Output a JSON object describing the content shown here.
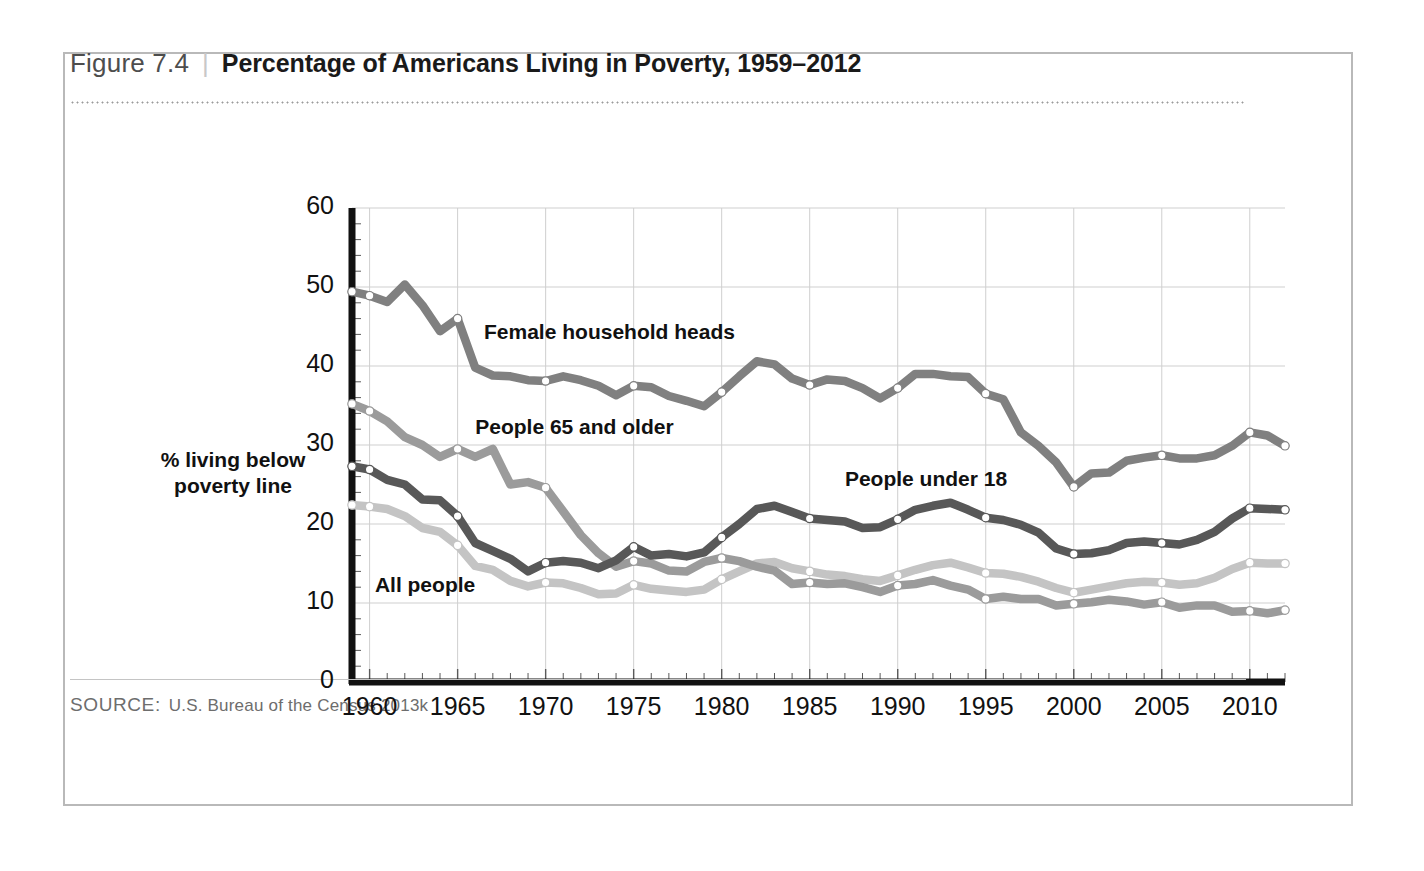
{
  "figure": {
    "number": "Figure 7.4",
    "separator": "|",
    "title": "Percentage of Americans Living in Poverty, 1959–2012"
  },
  "source": {
    "label": "SOURCE:",
    "text": "U.S. Bureau of the Census 2013k"
  },
  "colors": {
    "female_household_heads": "#808080",
    "people_65_and_older": "#9b9b9b",
    "people_under_18": "#585858",
    "all_people": "#c4c4c4",
    "axis": "#111111",
    "grid": "#cfcfcf",
    "frame": "#b9b9b9",
    "marker_fill": "#ffffff"
  },
  "chart_data": {
    "type": "line",
    "title": "Percentage of Americans Living in Poverty, 1959–2012",
    "xlabel": "",
    "ylabel": "% living below poverty line",
    "xlim": [
      1959,
      2012
    ],
    "ylim": [
      0,
      60
    ],
    "xticks": [
      1960,
      1965,
      1970,
      1975,
      1980,
      1985,
      1990,
      1995,
      2000,
      2005,
      2010
    ],
    "yticks": [
      0,
      10,
      20,
      30,
      40,
      50,
      60
    ],
    "grid": true,
    "minor_xticks": "every year",
    "legend": "inline labels on plot",
    "x": [
      1959,
      1960,
      1961,
      1962,
      1963,
      1964,
      1965,
      1966,
      1967,
      1968,
      1969,
      1970,
      1971,
      1972,
      1973,
      1974,
      1975,
      1976,
      1977,
      1978,
      1979,
      1980,
      1981,
      1982,
      1983,
      1984,
      1985,
      1986,
      1987,
      1988,
      1989,
      1990,
      1991,
      1992,
      1993,
      1994,
      1995,
      1996,
      1997,
      1998,
      1999,
      2000,
      2001,
      2002,
      2003,
      2004,
      2005,
      2006,
      2007,
      2008,
      2009,
      2010,
      2011,
      2012
    ],
    "series": [
      {
        "name": "Female household heads",
        "color": "#808080",
        "label_x": 1966.5,
        "label_y": 44.0,
        "marker_years": [
          1959,
          1960,
          1965,
          1970,
          1975,
          1980,
          1985,
          1990,
          1995,
          2000,
          2005,
          2010,
          2012
        ],
        "values": [
          49.4,
          48.9,
          48.1,
          50.3,
          47.7,
          44.4,
          46.0,
          39.8,
          38.8,
          38.7,
          38.2,
          38.1,
          38.7,
          38.2,
          37.5,
          36.3,
          37.5,
          37.3,
          36.2,
          35.6,
          34.9,
          36.7,
          38.7,
          40.6,
          40.2,
          38.4,
          37.6,
          38.3,
          38.1,
          37.2,
          35.9,
          37.2,
          39.0,
          39.0,
          38.7,
          38.6,
          36.5,
          35.8,
          31.6,
          29.9,
          27.8,
          24.7,
          26.4,
          26.5,
          28.0,
          28.4,
          28.7,
          28.3,
          28.3,
          28.7,
          29.9,
          31.6,
          31.2,
          29.9
        ]
      },
      {
        "name": "People 65 and older",
        "color": "#9b9b9b",
        "label_x": 1966.0,
        "label_y": 32.0,
        "marker_years": [
          1959,
          1960,
          1965,
          1970,
          1975,
          1980,
          1985,
          1990,
          1995,
          2000,
          2005,
          2010,
          2012
        ],
        "values": [
          35.2,
          34.3,
          33.0,
          31.0,
          30.0,
          28.5,
          29.5,
          28.5,
          29.5,
          25.0,
          25.3,
          24.6,
          21.6,
          18.6,
          16.3,
          14.6,
          15.3,
          15.0,
          14.1,
          14.0,
          15.2,
          15.7,
          15.3,
          14.6,
          14.1,
          12.4,
          12.6,
          12.4,
          12.5,
          12.0,
          11.4,
          12.2,
          12.4,
          12.9,
          12.2,
          11.7,
          10.5,
          10.8,
          10.5,
          10.5,
          9.7,
          9.9,
          10.1,
          10.4,
          10.2,
          9.8,
          10.1,
          9.4,
          9.7,
          9.7,
          8.9,
          9.0,
          8.7,
          9.1
        ]
      },
      {
        "name": "People under 18",
        "color": "#585858",
        "label_x": 1987.0,
        "label_y": 25.5,
        "marker_years": [
          1959,
          1960,
          1965,
          1970,
          1975,
          1980,
          1985,
          1990,
          1995,
          2000,
          2005,
          2010,
          2012
        ],
        "values": [
          27.3,
          26.9,
          25.6,
          25.0,
          23.1,
          23.0,
          21.0,
          17.6,
          16.6,
          15.6,
          14.0,
          15.1,
          15.3,
          15.1,
          14.4,
          15.4,
          17.1,
          16.0,
          16.2,
          15.9,
          16.4,
          18.3,
          20.0,
          21.9,
          22.3,
          21.5,
          20.7,
          20.5,
          20.3,
          19.5,
          19.6,
          20.6,
          21.8,
          22.3,
          22.7,
          21.8,
          20.8,
          20.5,
          19.9,
          18.9,
          16.9,
          16.2,
          16.3,
          16.7,
          17.6,
          17.8,
          17.6,
          17.4,
          18.0,
          19.0,
          20.7,
          22.0,
          21.9,
          21.8
        ]
      },
      {
        "name": "All people",
        "color": "#c4c4c4",
        "label_x": 1960.3,
        "label_y": 12.0,
        "marker_years": [
          1959,
          1960,
          1965,
          1970,
          1975,
          1980,
          1985,
          1990,
          1995,
          2000,
          2005,
          2010,
          2012
        ],
        "values": [
          22.4,
          22.2,
          21.9,
          21.0,
          19.5,
          19.0,
          17.3,
          14.7,
          14.2,
          12.8,
          12.1,
          12.6,
          12.5,
          11.9,
          11.1,
          11.2,
          12.3,
          11.8,
          11.6,
          11.4,
          11.7,
          13.0,
          14.0,
          15.0,
          15.2,
          14.4,
          14.0,
          13.6,
          13.4,
          13.0,
          12.8,
          13.5,
          14.2,
          14.8,
          15.1,
          14.5,
          13.8,
          13.7,
          13.3,
          12.7,
          11.9,
          11.3,
          11.7,
          12.1,
          12.5,
          12.7,
          12.6,
          12.3,
          12.5,
          13.2,
          14.3,
          15.1,
          15.0,
          15.0
        ]
      }
    ]
  }
}
